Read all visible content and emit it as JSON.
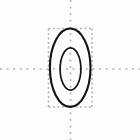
{
  "figure": {
    "title": "",
    "canvas": {
      "width": 140,
      "height": 140,
      "background": "#fdfdfd"
    },
    "colors": {
      "curve_stroke": "#141414",
      "guide_dotted": "#b2b2b2",
      "axis_dotted": "#b2b2b2",
      "background": "#fdfdfd"
    },
    "axes": {
      "vertical_axis": {
        "label": "y-axis",
        "x": 70.5,
        "y_start": 0,
        "y_end": 140,
        "style": "dotted",
        "dash": "2 4.6",
        "width": 1.6
      },
      "horizontal_axis": {
        "label": "x-axis",
        "y": 69,
        "x_start": 0,
        "x_end": 140,
        "style": "dotted",
        "dash": "2 4.6",
        "width": 1.6
      },
      "origin": {
        "x": 70.5,
        "y": 69
      }
    },
    "bounding_box": {
      "label": "tangent-bounding-box",
      "left": 48.5,
      "right": 92,
      "top": 28.5,
      "bottom": 107,
      "style": "dotted",
      "dash": "1.9 2.6",
      "width": 1.5
    },
    "ellipses": [
      {
        "name": "outer-ellipse",
        "cx": 70.2,
        "cy": 67.7,
        "rx": 20.3,
        "ry": 39.2,
        "stroke_width": 2.1,
        "fill": "none"
      },
      {
        "name": "inner-ellipse",
        "cx": 70.5,
        "cy": 69,
        "rx": 10.4,
        "ry": 21.2,
        "stroke_width": 1.7,
        "fill": "none"
      }
    ],
    "chart_data": {
      "type": "scatter",
      "title": "",
      "xlabel": "",
      "ylabel": "",
      "grid": false,
      "legend": "none",
      "description": "Two nested concentric ellipses centered near the origin, with dotted coordinate axes and a dotted rectangle circumscribing the outer ellipse.",
      "xlim": [
        -70.5,
        69.5
      ],
      "ylim": [
        -71,
        69
      ],
      "series": [
        {
          "name": "outer-ellipse",
          "kind": "ellipse",
          "center": [
            -0.3,
            1.3
          ],
          "semi_axis_x": 20.3,
          "semi_axis_y": 39.2
        },
        {
          "name": "inner-ellipse",
          "kind": "ellipse",
          "center": [
            0,
            0
          ],
          "semi_axis_x": 10.4,
          "semi_axis_y": 21.2
        },
        {
          "name": "tangent-bounding-box",
          "kind": "rectangle",
          "x_range": [
            -22,
            21.5
          ],
          "y_range": [
            -38,
            40.5
          ]
        }
      ]
    }
  }
}
